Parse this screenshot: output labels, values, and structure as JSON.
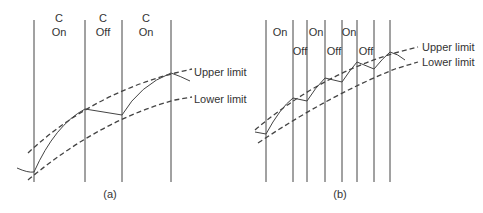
{
  "panel_a": {
    "caption": "(a)",
    "segments": [
      {
        "top": "C",
        "bottom": "On"
      },
      {
        "top": "C",
        "bottom": "Off"
      },
      {
        "top": "C",
        "bottom": "On"
      }
    ],
    "upper_label": "Upper limit",
    "lower_label": "Lower limit"
  },
  "panel_b": {
    "caption": "(b)",
    "on_labels": [
      "On",
      "On",
      "On"
    ],
    "off_labels": [
      "Off",
      "Off",
      "Off"
    ],
    "upper_label": "Upper limit",
    "lower_label": "Lower limit"
  }
}
